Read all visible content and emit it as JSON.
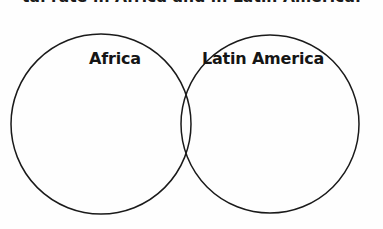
{
  "image": {
    "width": 383,
    "height": 229,
    "background_color": "#fefefe"
  },
  "caption": {
    "text": "tal rate in Africa and in Latin America.",
    "note": "top caption line is cropped by the image frame; only glyph bottoms visible",
    "color": "#1a1a1a"
  },
  "diagram": {
    "type": "venn",
    "stroke_color": "#1a1a1a",
    "fill_color": "none",
    "sets": [
      {
        "id": "left",
        "label": "Africa",
        "center_x": 101,
        "center_y": 124,
        "radius": 90
      },
      {
        "id": "right",
        "label": "Latin America",
        "center_x": 270,
        "center_y": 124,
        "radius": 89
      }
    ],
    "intersection": {
      "label": "",
      "top_crossing_x": 185,
      "top_crossing_y": 58,
      "bottom_crossing_x": 187,
      "bottom_crossing_y": 190
    }
  }
}
